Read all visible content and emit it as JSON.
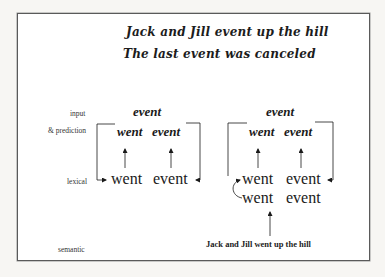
{
  "titles": {
    "line1": "Jack and Jill event up the hill",
    "line2": "The last event was canceled"
  },
  "levels": {
    "input": "input",
    "prediction": "& prediction",
    "lexical": "lexical",
    "semantic": "semantic"
  },
  "left_diagram": {
    "input_word": "event",
    "prediction_words": [
      "went",
      "event"
    ],
    "lexical_words": [
      "went",
      "event"
    ]
  },
  "right_diagram": {
    "input_word": "event",
    "prediction_words": [
      "went",
      "event"
    ],
    "lexical_words_row1": [
      "went",
      "event"
    ],
    "lexical_words_row2": [
      "went",
      "event"
    ],
    "semantic_caption": "Jack and Jill went up the hill"
  },
  "colors": {
    "border": "#5a5a5a",
    "ink": "#1a1a1a",
    "background": "#ffffff"
  }
}
